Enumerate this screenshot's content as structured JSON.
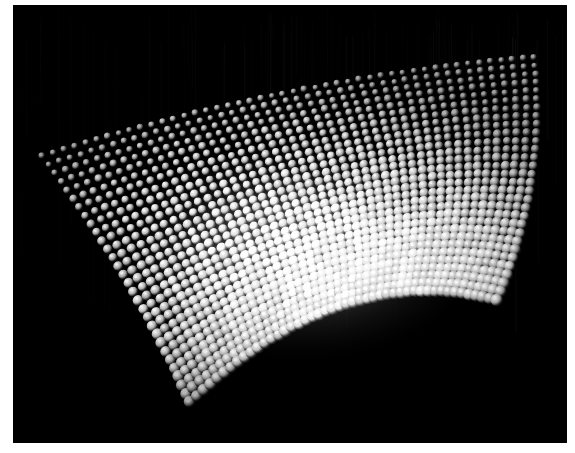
{
  "scene": {
    "title": "Curved lattice of specular spheres",
    "kind": "3d-point-cloud-render",
    "background_color": "#000000",
    "page_margin_color": "#ffffff",
    "highlight_color": "#ffffff",
    "sphere_base_color": "#9a9a9a",
    "sphere_shadow_color": "#050505",
    "viewport": {
      "x": 13,
      "y": 5,
      "width": 554,
      "height": 438
    }
  },
  "lattice": {
    "columns": 46,
    "rows": 30,
    "corners": {
      "top_left": {
        "x": 42,
        "y": 156
      },
      "top_right": {
        "x": 534,
        "y": 57
      },
      "bottom_right": {
        "x": 497,
        "y": 300
      },
      "bottom_left": {
        "x": 190,
        "y": 402
      }
    },
    "curvature": {
      "top_edge_sag": -14,
      "bottom_edge_sag": -46,
      "left_edge_sag": 10,
      "right_edge_sag": 16
    },
    "sphere_radius_near": 6.2,
    "sphere_radius_far": 3.2
  },
  "lighting": {
    "bloom_center": {
      "x": 300,
      "y": 250
    },
    "bloom_radius_x": 175,
    "bloom_radius_y": 105,
    "bloom_strength": 1.0,
    "falloff_top": 0.18,
    "falloff_bottom": 0.12,
    "specular_offset": {
      "x": -0.34,
      "y": -0.36
    }
  },
  "streaks": {
    "count": 130,
    "region": {
      "x": 0,
      "y": 0,
      "width": 554,
      "height": 330
    },
    "max_opacity": 0.22,
    "color": "#6d6d6d"
  }
}
